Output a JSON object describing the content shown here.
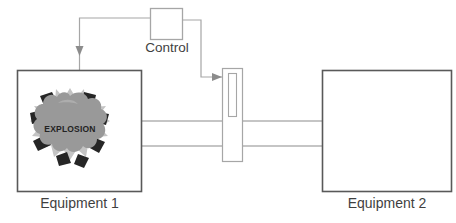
{
  "diagram": {
    "title": "",
    "nodes": {
      "equipment1": {
        "label": "Equipment 1",
        "shape": "rectangle",
        "x": 17,
        "y": 70,
        "width": 125,
        "height": 122,
        "border_color": "#595959",
        "fill_color": "#ffffff"
      },
      "equipment2": {
        "label": "Equipment 2",
        "shape": "rectangle",
        "x": 322,
        "y": 70,
        "width": 130,
        "height": 122,
        "border_color": "#595959",
        "fill_color": "#ffffff"
      },
      "control": {
        "label": "Control",
        "shape": "rectangle",
        "x": 150,
        "y": 8,
        "width": 33,
        "height": 32,
        "border_color": "#a6a6a6",
        "fill_color": "#ffffff"
      },
      "valve": {
        "label": "",
        "shape": "valve-rectangle",
        "x": 222,
        "y": 68,
        "width": 21,
        "height": 94,
        "border_color": "#a6a6a6",
        "fill_color": "#ffffff",
        "slot": {
          "x": 228,
          "y": 73,
          "width": 9,
          "height": 44
        }
      }
    },
    "explosion": {
      "text": "EXPLOSION",
      "cloud_color": "#999999",
      "burst_color": "#bfbfbf",
      "fragment_color": "#262626",
      "center_x": 70,
      "center_y": 128,
      "radius": 34
    },
    "connections": [
      {
        "name": "equipment1-to-control",
        "from": "equipment1",
        "to": "control",
        "style": "elbow",
        "arrow": "up-into-equipment1",
        "color": "#a6a6a6"
      },
      {
        "name": "control-to-valve",
        "from": "control",
        "to": "valve",
        "style": "elbow",
        "arrow": "right-into-valve",
        "color": "#a6a6a6"
      },
      {
        "name": "pipe-upper",
        "from": "equipment1",
        "to": "equipment2",
        "style": "straight",
        "arrow": "none",
        "color": "#8c8c8c",
        "y": 121
      },
      {
        "name": "pipe-lower",
        "from": "equipment1",
        "to": "equipment2",
        "style": "straight",
        "arrow": "none",
        "color": "#8c8c8c",
        "y": 146
      }
    ]
  }
}
